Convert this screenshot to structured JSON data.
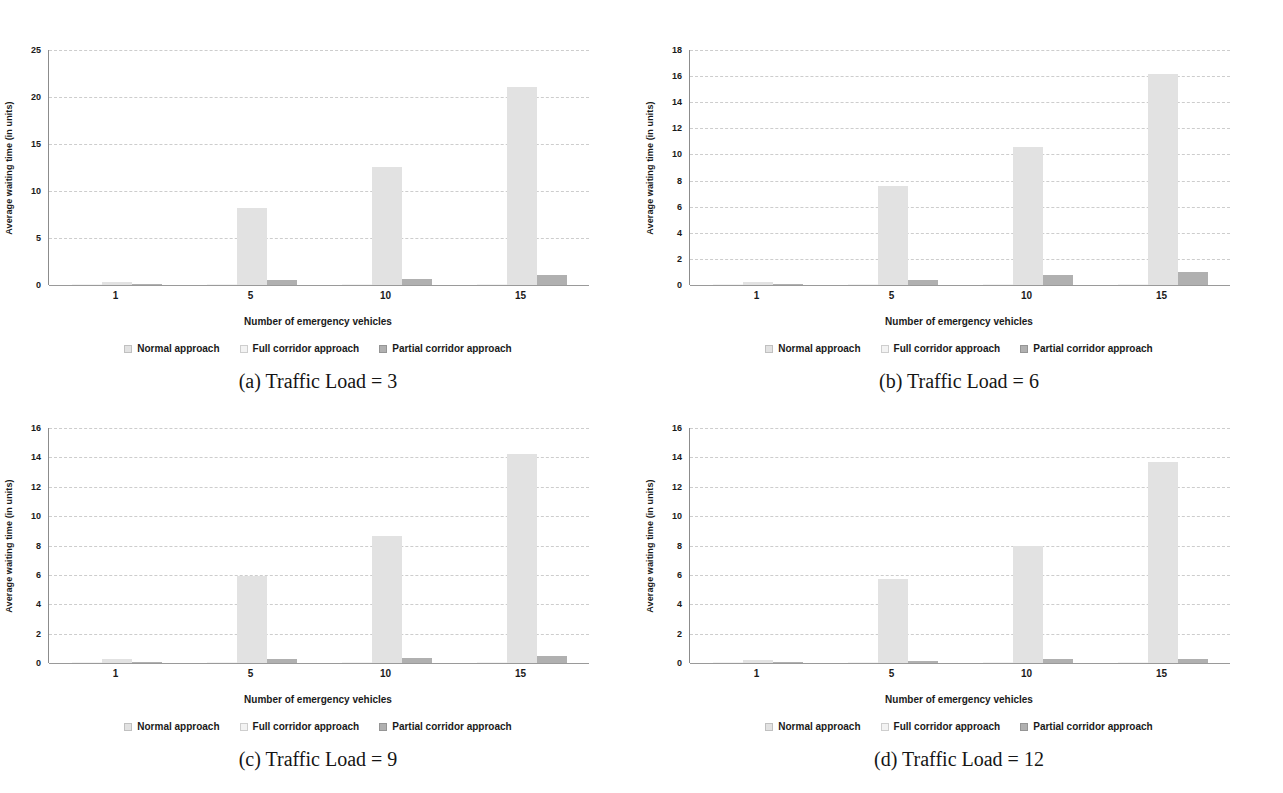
{
  "figure": {
    "background": "#ffffff",
    "text_color": "#1a1a1a",
    "gridline_color": "#cdcdcd",
    "axis_color": "#8c8c8c"
  },
  "chart_data": [
    {
      "id": "a",
      "type": "bar",
      "caption": "(a) Traffic Load = 3",
      "xlabel": "Number of emergency vehicles",
      "ylabel": "Average waiting time (in units)",
      "categories": [
        "1",
        "5",
        "10",
        "15"
      ],
      "ylim": [
        0,
        25
      ],
      "ytick_step": 5,
      "grid": "horizontal-dashed",
      "legend_position": "bottom",
      "series": [
        {
          "name": "Normal approach",
          "color": "#e2e2e2",
          "values": [
            0.3,
            8.2,
            12.6,
            21.1
          ]
        },
        {
          "name": "Full corridor approach",
          "color": "#f3f3f3",
          "values": [
            0.05,
            0.1,
            0.1,
            0.15
          ]
        },
        {
          "name": "Partial corridor approach",
          "color": "#b0b0b0",
          "values": [
            0.15,
            0.5,
            0.65,
            1.1
          ]
        }
      ]
    },
    {
      "id": "b",
      "type": "bar",
      "caption": "(b) Traffic Load = 6",
      "xlabel": "Number of emergency vehicles",
      "ylabel": "Average waiting time (in units)",
      "categories": [
        "1",
        "5",
        "10",
        "15"
      ],
      "ylim": [
        0,
        18
      ],
      "ytick_step": 2,
      "grid": "horizontal-dashed",
      "legend_position": "bottom",
      "series": [
        {
          "name": "Normal approach",
          "color": "#e2e2e2",
          "values": [
            0.2,
            7.55,
            10.55,
            16.2
          ]
        },
        {
          "name": "Full corridor approach",
          "color": "#f3f3f3",
          "values": [
            0.05,
            0.05,
            0.1,
            0.1
          ]
        },
        {
          "name": "Partial corridor approach",
          "color": "#b0b0b0",
          "values": [
            0.05,
            0.35,
            0.8,
            1.0
          ]
        }
      ]
    },
    {
      "id": "c",
      "type": "bar",
      "caption": "(c) Traffic Load = 9",
      "xlabel": "Number of emergency vehicles",
      "ylabel": "Average waiting time (in units)",
      "categories": [
        "1",
        "5",
        "10",
        "15"
      ],
      "ylim": [
        0,
        16
      ],
      "ytick_step": 2,
      "grid": "horizontal-dashed",
      "legend_position": "bottom",
      "series": [
        {
          "name": "Normal approach",
          "color": "#e2e2e2",
          "values": [
            0.3,
            5.9,
            8.65,
            14.25
          ]
        },
        {
          "name": "Full corridor approach",
          "color": "#f3f3f3",
          "values": [
            0.05,
            0.05,
            0.1,
            0.1
          ]
        },
        {
          "name": "Partial corridor approach",
          "color": "#b0b0b0",
          "values": [
            0.05,
            0.25,
            0.35,
            0.5
          ]
        }
      ]
    },
    {
      "id": "d",
      "type": "bar",
      "caption": "(d) Traffic Load = 12",
      "xlabel": "Number of emergency vehicles",
      "ylabel": "Average waiting time (in units)",
      "categories": [
        "1",
        "5",
        "10",
        "15"
      ],
      "ylim": [
        0,
        16
      ],
      "ytick_step": 2,
      "grid": "horizontal-dashed",
      "legend_position": "bottom",
      "series": [
        {
          "name": "Normal approach",
          "color": "#e2e2e2",
          "values": [
            0.2,
            5.7,
            8.0,
            13.7
          ]
        },
        {
          "name": "Full corridor approach",
          "color": "#f3f3f3",
          "values": [
            0.05,
            0.05,
            0.05,
            0.1
          ]
        },
        {
          "name": "Partial corridor approach",
          "color": "#b0b0b0",
          "values": [
            0.05,
            0.15,
            0.25,
            0.3
          ]
        }
      ]
    }
  ]
}
